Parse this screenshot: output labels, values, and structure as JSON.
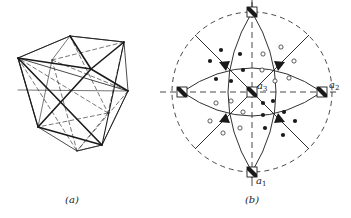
{
  "figure": {
    "panel_a": {
      "caption": "(a)",
      "description": "wireframe polyhedron with solid and dashed edges"
    },
    "panel_b": {
      "caption": "(b)",
      "description": "stereographic projection with symmetry elements",
      "axis_labels": {
        "a1": {
          "letter": "a",
          "sub": "1"
        },
        "a2": {
          "letter": "a",
          "sub": "2"
        },
        "a3": {
          "letter": "a",
          "sub": "3"
        }
      },
      "symbols": {
        "fourfold_axis": "square-with-diagonal",
        "threefold_axis": "filled-triangle",
        "upper_pole": "filled-dot",
        "lower_pole": "open-circle"
      },
      "colors": {
        "ink": "#1a1a1a",
        "background": "#ffffff"
      }
    }
  }
}
